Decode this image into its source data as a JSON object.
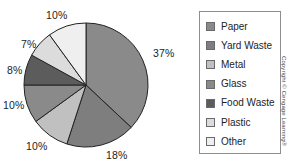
{
  "chart_data": {
    "type": "pie",
    "title": "",
    "subtitle": "",
    "xlabel": "",
    "ylabel": "",
    "legend_position": "right",
    "grid": false,
    "start_angle_deg": 0,
    "direction": "clockwise",
    "categories": [
      "Paper",
      "Yard Waste",
      "Metal",
      "Glass",
      "Food Waste",
      "Plastic",
      "Other"
    ],
    "values": [
      37,
      18,
      10,
      10,
      8,
      7,
      10
    ],
    "value_labels": [
      "37%",
      "18%",
      "10%",
      "10%",
      "8%",
      "7%",
      "10%"
    ],
    "colors": [
      "#8a8a8a",
      "#7e7e7e",
      "#c0c0c0",
      "#8a8a8a",
      "#5c5c5c",
      "#dcdcdc",
      "#efefef"
    ],
    "slices": [
      {
        "label": "Paper",
        "value": 37,
        "value_label": "37%",
        "color": "#8a8a8a"
      },
      {
        "label": "Yard Waste",
        "value": 18,
        "value_label": "18%",
        "color": "#7e7e7e"
      },
      {
        "label": "Metal",
        "value": 10,
        "value_label": "10%",
        "color": "#c0c0c0"
      },
      {
        "label": "Glass",
        "value": 10,
        "value_label": "10%",
        "color": "#8a8a8a"
      },
      {
        "label": "Food Waste",
        "value": 8,
        "value_label": "8%",
        "color": "#5c5c5c"
      },
      {
        "label": "Plastic",
        "value": 7,
        "value_label": "7%",
        "color": "#dcdcdc"
      },
      {
        "label": "Other",
        "value": 10,
        "value_label": "10%",
        "color": "#efefef"
      }
    ]
  },
  "legend": {
    "items": [
      {
        "label": "Paper",
        "color": "#8a8a8a"
      },
      {
        "label": "Yard Waste",
        "color": "#7e7e7e"
      },
      {
        "label": "Metal",
        "color": "#c0c0c0"
      },
      {
        "label": "Glass",
        "color": "#8a8a8a"
      },
      {
        "label": "Food Waste",
        "color": "#5c5c5c"
      },
      {
        "label": "Plastic",
        "color": "#dcdcdc"
      },
      {
        "label": "Other",
        "color": "#efefef"
      }
    ]
  },
  "credit": {
    "text": "Copyright © Cengage Learning®"
  },
  "style": {
    "slice_outline": "#222222",
    "legend_border": "#8e8e8e",
    "text_color": "#1d1d1d",
    "background": "#ffffff"
  }
}
